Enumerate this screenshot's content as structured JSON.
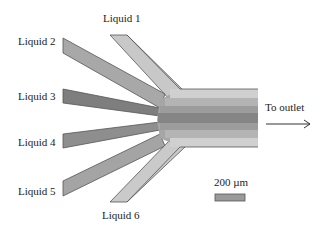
{
  "diagram": {
    "type": "microfluidic-hydrodynamic-focusing",
    "inlets": [
      {
        "id": 1,
        "label": "Liquid 1",
        "color": "#c8c8c8"
      },
      {
        "id": 2,
        "label": "Liquid 2",
        "color": "#a8a8a8"
      },
      {
        "id": 3,
        "label": "Liquid 3",
        "color": "#7e7e7e"
      },
      {
        "id": 4,
        "label": "Liquid 4",
        "color": "#8e8e8e"
      },
      {
        "id": 5,
        "label": "Liquid 5",
        "color": "#a4a4a4"
      },
      {
        "id": 6,
        "label": "Liquid 6",
        "color": "#cacaca"
      }
    ],
    "outlet": {
      "label": "To outlet",
      "stripes": [
        "#d0d0d0",
        "#b4b4b4",
        "#9c9c9c",
        "#858585",
        "#9c9c9c",
        "#b4b4b4",
        "#d0d0d0"
      ]
    },
    "scale_bar": {
      "label": "200 µm",
      "color": "#9a9a9a"
    },
    "edge_color": "#555555"
  }
}
